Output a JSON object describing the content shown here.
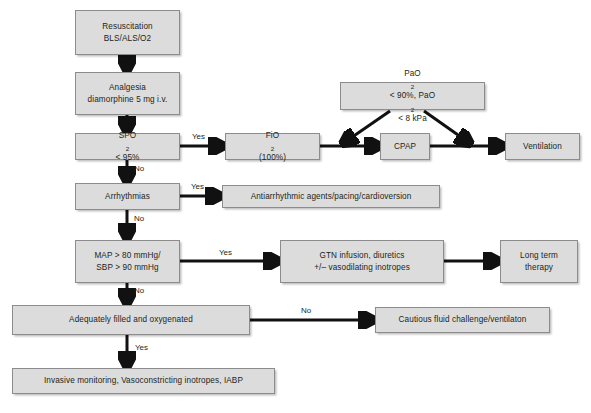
{
  "diagram": {
    "type": "flowchart",
    "colors": {
      "node_fill": "#dcdcdc",
      "node_border": "#8c8c8c",
      "connector": "#111111",
      "text": "#231f20",
      "background": "#ffffff"
    },
    "nodes": [
      {
        "id": "resuscitation",
        "line1": "Resuscitation",
        "line2": "BLS/ALS/O2"
      },
      {
        "id": "analgesia",
        "line1": "Analgesia",
        "line2": "diamorphine 5 mg i.v."
      },
      {
        "id": "spo2",
        "line1_pre": "SPO",
        "line1_sub": "2",
        "line1_post": " < 95%"
      },
      {
        "id": "fio2",
        "line1_pre": "FiO",
        "line1_sub": "2",
        "line1_post": " (100%)"
      },
      {
        "id": "pao2",
        "line1_pre": "PaO",
        "line1_sub": "2",
        "line1_mid": " < 90%, PaO",
        "line1_sub2": "2",
        "line1_post": " < 8 kPa"
      },
      {
        "id": "cpap",
        "line1": "CPAP"
      },
      {
        "id": "ventilation",
        "line1": "Ventilation"
      },
      {
        "id": "arrhythmias",
        "line1": "Arrhythmias"
      },
      {
        "id": "antiarrhythmic",
        "line1": "Antiarrhythmic agents/pacing/cardioversion"
      },
      {
        "id": "map_sbp",
        "line1": "MAP > 80 mmHg/",
        "line2": "SBP > 90 mmHg"
      },
      {
        "id": "gtn",
        "line1": "GTN infusion, diuretics",
        "line2": "+/– vasodilating inotropes"
      },
      {
        "id": "long_term",
        "line1": "Long term",
        "line2": "therapy"
      },
      {
        "id": "adequately",
        "line1": "Adequately filled and oxygenated"
      },
      {
        "id": "cautious",
        "line1": "Cautious fluid challenge/ventilaton"
      },
      {
        "id": "invasive",
        "line1": "Invasive monitoring, Vasoconstricting inotropes, IABP"
      }
    ],
    "edge_labels": [
      {
        "id": "spo2-yes",
        "text": "Yes"
      },
      {
        "id": "spo2-no",
        "text": "No"
      },
      {
        "id": "arrhythmias-yes",
        "text": "Yes"
      },
      {
        "id": "arrhythmias-no",
        "text": "No"
      },
      {
        "id": "map-yes",
        "text": "Yes"
      },
      {
        "id": "map-no",
        "text": "No"
      },
      {
        "id": "adequately-no",
        "text": "No"
      },
      {
        "id": "adequately-yes",
        "text": "Yes"
      }
    ]
  }
}
